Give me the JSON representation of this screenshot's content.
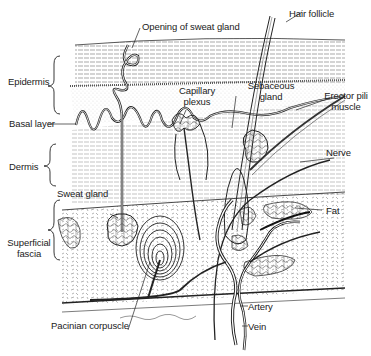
{
  "labels": {
    "opening_sweat_gland": "Opening of sweat gland",
    "hair_follicle": "Hair follicle",
    "epidermis": "Epidermis",
    "capillary_plexus_1": "Capillary",
    "capillary_plexus_2": "plexus",
    "sebaceous_gland_1": "Sebaceous",
    "sebaceous_gland_2": "gland",
    "erector_pili_1": "Erector pili",
    "erector_pili_2": "muscle",
    "basal_layer": "Basal layer",
    "nerve": "Nerve",
    "dermis": "Dermis",
    "sweat_gland": "Sweat gland",
    "fat": "Fat",
    "superficial_fascia_1": "Superficial",
    "superficial_fascia_2": "fascia",
    "artery": "Artery",
    "vein": "Vein",
    "pacinian_corpuscle": "Pacinian corpuscle"
  },
  "colors": {
    "ink": "#222222",
    "background": "#ffffff"
  }
}
